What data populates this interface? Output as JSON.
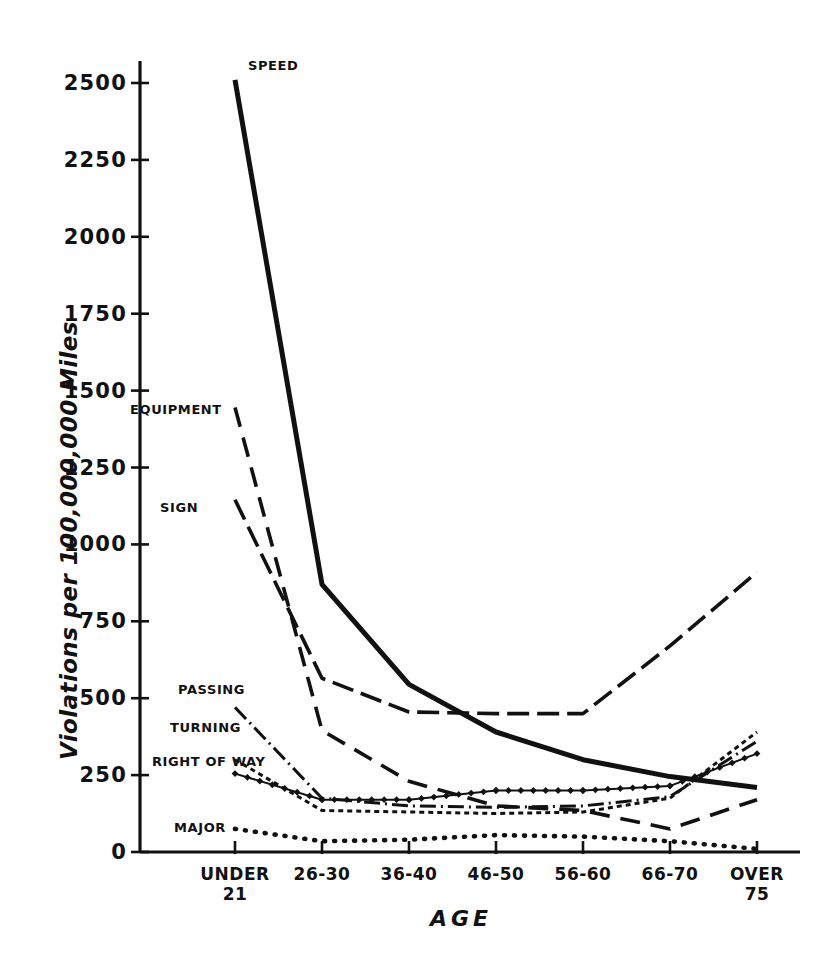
{
  "chart_data": {
    "type": "line",
    "title": "",
    "xlabel": "AGE",
    "ylabel": "Violations per 100,000,000 Miles",
    "categories": [
      "UNDER 21",
      "26-30",
      "36-40",
      "46-50",
      "56-60",
      "66-70",
      "OVER 75"
    ],
    "category_lines": [
      [
        "UNDER",
        "21"
      ],
      [
        "26-30",
        ""
      ],
      [
        "36-40",
        ""
      ],
      [
        "46-50",
        ""
      ],
      [
        "56-60",
        ""
      ],
      [
        "66-70",
        ""
      ],
      [
        "OVER",
        "75"
      ]
    ],
    "ylim": [
      0,
      2500
    ],
    "yticks": [
      0,
      250,
      500,
      750,
      1000,
      1250,
      1500,
      1750,
      2000,
      2250,
      2500
    ],
    "grid": false,
    "legend": "inline-labels-left",
    "series": [
      {
        "name": "SPEED",
        "style": "solid-thick",
        "label_x": 248,
        "label_y": 66,
        "values": [
          2510,
          870,
          545,
          390,
          300,
          245,
          210
        ]
      },
      {
        "name": "EQUIPMENT",
        "style": "long-dash",
        "label_x": 130,
        "label_y": 410,
        "values": [
          1445,
          395,
          230,
          150,
          135,
          75,
          170
        ]
      },
      {
        "name": "SIGN",
        "style": "dash-dot",
        "label_x": 160,
        "label_y": 508,
        "values": [
          1145,
          565,
          455,
          450,
          450,
          670,
          910
        ]
      },
      {
        "name": "PASSING",
        "style": "dash-dot-fine",
        "label_x": 178,
        "label_y": 690,
        "values": [
          470,
          175,
          150,
          145,
          150,
          180,
          360
        ]
      },
      {
        "name": "TURNING",
        "style": "dot-dense",
        "label_x": 170,
        "label_y": 728,
        "values": [
          300,
          135,
          130,
          125,
          130,
          175,
          390
        ]
      },
      {
        "name": "RIGHT OF WAY",
        "style": "thin-solid-marked",
        "label_x": 152,
        "label_y": 762,
        "values": [
          255,
          170,
          170,
          200,
          200,
          215,
          320
        ]
      },
      {
        "name": "MAJOR",
        "style": "dotted",
        "label_x": 174,
        "label_y": 828,
        "values": [
          75,
          35,
          40,
          55,
          50,
          35,
          10
        ]
      }
    ]
  },
  "axes": {
    "plot_left": 140,
    "plot_right": 800,
    "plot_top": 83,
    "plot_bottom": 852,
    "x_positions": [
      235,
      322,
      409,
      496,
      583,
      670,
      757
    ]
  }
}
